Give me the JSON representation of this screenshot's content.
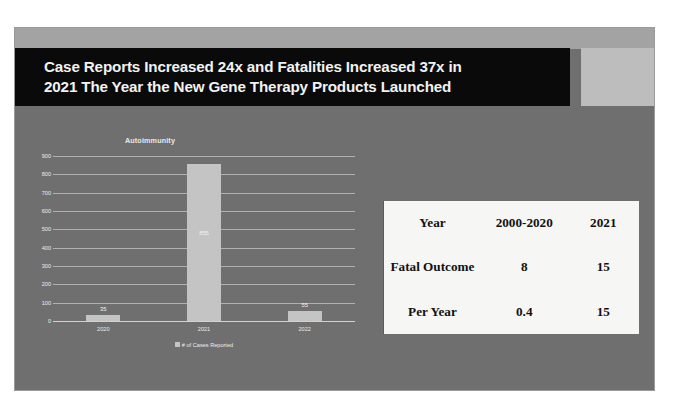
{
  "slide": {
    "title_line1": "Case Reports Increased 24x and Fatalities Increased 37x in",
    "title_line2": "2021 The Year the New Gene Therapy Products Launched",
    "background_color": "#6f6f6f",
    "title_banner_color": "#0a0a0a",
    "title_text_color": "#f2f2f2"
  },
  "chart_data": {
    "type": "bar",
    "title": "Autoimmunity",
    "categories": [
      "2020",
      "2021",
      "2022"
    ],
    "values": [
      35,
      855,
      55
    ],
    "series": [
      {
        "name": "# of Cases Reported",
        "values": [
          35,
          855,
          55
        ]
      }
    ],
    "legend": [
      "# of Cases Reported"
    ],
    "legend_position": "bottom",
    "xlabel": "",
    "ylabel": "",
    "ylim": [
      0,
      900
    ],
    "yticks": [
      "900",
      "800",
      "700",
      "600",
      "500",
      "400",
      "300",
      "200",
      "100",
      "0"
    ],
    "ytick_values": [
      900,
      800,
      700,
      600,
      500,
      400,
      300,
      200,
      100,
      0
    ],
    "grid": true,
    "bar_color": "#c4c4c4",
    "data_labels": [
      "35",
      "855",
      "55"
    ]
  },
  "table": {
    "rows": [
      {
        "label": "Year",
        "col2": "2000-2020",
        "col3": "2021"
      },
      {
        "label": "Fatal Outcome",
        "col2": "8",
        "col3": "15"
      },
      {
        "label": "Per Year",
        "col2": "0.4",
        "col3": "15"
      }
    ],
    "background_color": "#f6f6f4",
    "text_color": "#121212"
  }
}
